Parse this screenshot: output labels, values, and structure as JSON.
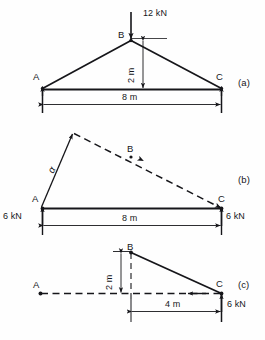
{
  "figure": {
    "background_color": "#fefefe",
    "line_color": "#16161a",
    "width": 265,
    "height": 340
  },
  "panels": [
    {
      "tag": "(a)",
      "name": "loaded-truss",
      "points": [
        {
          "label": "A",
          "name": "point-a"
        },
        {
          "label": "B",
          "name": "point-b"
        },
        {
          "label": "C",
          "name": "point-c"
        }
      ],
      "loads": [
        {
          "label": "12 kN",
          "name": "applied-load-12kn",
          "direction": "down"
        }
      ],
      "dimensions": [
        {
          "label": "2 m",
          "name": "rise-dimension",
          "orientation": "vertical"
        },
        {
          "label": "8 m",
          "name": "span-dimension",
          "orientation": "horizontal"
        }
      ]
    },
    {
      "tag": "(b)",
      "name": "reaction-force-diagram",
      "points": [
        {
          "label": "A",
          "name": "point-a"
        },
        {
          "label": "B",
          "name": "point-b"
        },
        {
          "label": "C",
          "name": "point-c"
        }
      ],
      "loads": [
        {
          "label": "6 kN",
          "name": "reaction-left-6kn",
          "direction": "up"
        },
        {
          "label": "6 kN",
          "name": "reaction-right-6kn",
          "direction": "up"
        }
      ],
      "angles": [
        {
          "label": "α",
          "name": "angle-alpha"
        }
      ],
      "dimensions": [
        {
          "label": "8 m",
          "name": "span-dimension",
          "orientation": "horizontal"
        }
      ]
    },
    {
      "tag": "(c)",
      "name": "right-segment-free-body",
      "points": [
        {
          "label": "A",
          "name": "point-a"
        },
        {
          "label": "B",
          "name": "point-b"
        },
        {
          "label": "C",
          "name": "point-c"
        }
      ],
      "loads": [
        {
          "label": "6 kN",
          "name": "reaction-right-6kn",
          "direction": "up"
        }
      ],
      "dimensions": [
        {
          "label": "2 m",
          "name": "rise-dimension",
          "orientation": "vertical"
        },
        {
          "label": "4 m",
          "name": "half-span-dimension",
          "orientation": "horizontal"
        }
      ]
    }
  ]
}
